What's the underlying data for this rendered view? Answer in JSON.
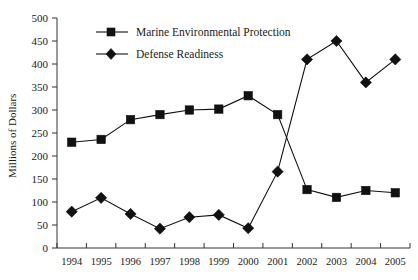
{
  "chart_data": {
    "type": "line",
    "title": "",
    "xlabel": "",
    "ylabel": "Millions of Dollars",
    "ylim": [
      0,
      500
    ],
    "ytick_step": 50,
    "grid": false,
    "legend_position": "top-center",
    "categories": [
      "1994",
      "1995",
      "1996",
      "1997",
      "1998",
      "1999",
      "2000",
      "2001",
      "2002",
      "2003",
      "2004",
      "2005"
    ],
    "series": [
      {
        "name": "Marine Environmental Protection",
        "marker": "square",
        "color": "#111111",
        "values": [
          230,
          236,
          279,
          290,
          300,
          302,
          331,
          290,
          127,
          110,
          125,
          120
        ]
      },
      {
        "name": "Defense Readiness",
        "marker": "diamond",
        "color": "#111111",
        "values": [
          79,
          109,
          74,
          42,
          67,
          72,
          43,
          166,
          410,
          450,
          360,
          410
        ]
      }
    ],
    "yticks": [
      "0",
      "50",
      "100",
      "150",
      "200",
      "250",
      "300",
      "350",
      "400",
      "450",
      "500"
    ]
  },
  "legend": {
    "entries": [
      {
        "label": "Marine Environmental Protection"
      },
      {
        "label": "Defense Readiness"
      }
    ]
  },
  "caption": ""
}
